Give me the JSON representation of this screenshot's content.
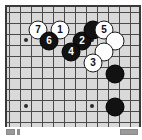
{
  "diagram": {
    "type": "go-board",
    "board": {
      "background_color": "#d9d9d9",
      "line_color": "#4a4a4a",
      "border_color": "#3a3a3a",
      "columns": 12,
      "rows": 11,
      "cell_size": 11,
      "star_points": [
        {
          "x": 24,
          "y": 38
        },
        {
          "x": 90,
          "y": 38
        },
        {
          "x": 24,
          "y": 104
        },
        {
          "x": 90,
          "y": 104
        }
      ]
    },
    "stones": [
      {
        "id": "stone-7",
        "color": "white",
        "label": "7",
        "x": 35,
        "y": 27
      },
      {
        "id": "stone-1",
        "color": "white",
        "label": "1",
        "x": 57,
        "y": 27
      },
      {
        "id": "stone-6",
        "color": "black",
        "label": "6",
        "x": 46,
        "y": 38
      },
      {
        "id": "stone-2",
        "color": "black",
        "label": "2",
        "x": 79,
        "y": 38
      },
      {
        "id": "stone-4",
        "color": "black",
        "label": "4",
        "x": 68,
        "y": 49
      },
      {
        "id": "stone-black-plain-1",
        "color": "black",
        "label": "",
        "x": 90,
        "y": 27
      },
      {
        "id": "stone-5",
        "color": "white",
        "label": "5",
        "x": 101,
        "y": 27
      },
      {
        "id": "stone-white-plain-1",
        "color": "white",
        "label": "",
        "x": 112,
        "y": 38
      },
      {
        "id": "stone-white-plain-2",
        "color": "white",
        "label": "",
        "x": 101,
        "y": 49
      },
      {
        "id": "stone-3",
        "color": "white",
        "label": "3",
        "x": 90,
        "y": 60
      },
      {
        "id": "stone-black-plain-2",
        "color": "black",
        "label": "",
        "x": 112,
        "y": 71
      },
      {
        "id": "stone-black-plain-3",
        "color": "black",
        "label": "",
        "x": 112,
        "y": 104
      }
    ],
    "footer": {
      "left_mark": "",
      "left_dot": "",
      "right_mark": ""
    }
  }
}
